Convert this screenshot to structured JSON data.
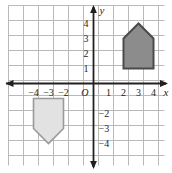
{
  "figure": {
    "origin_label": "O",
    "x_axis_label": "x",
    "y_axis_label": "y"
  },
  "colors": {
    "grid_line": "#b9b9b9",
    "axis_line": "#231f20",
    "background": "#ffffff",
    "shape_dark_fill": "#8c8c8c",
    "shape_dark_stroke": "#4a4a4a",
    "shape_light_fill": "#e2e2e2",
    "shape_light_stroke": "#9a9a9a",
    "text": "#231f20"
  },
  "chart_data": {
    "type": "scatter",
    "title": "",
    "xlabel": "x",
    "ylabel": "y",
    "grid": true,
    "legend": "none",
    "xlim": [
      -5.5,
      4.7
    ],
    "ylim": [
      -5.3,
      5
    ],
    "x_ticks": [
      {
        "value": -4,
        "label": "−4"
      },
      {
        "value": -3,
        "label": "−3"
      },
      {
        "value": -2,
        "label": "−2"
      },
      {
        "value": 1,
        "label": "1"
      },
      {
        "value": 2,
        "label": "2"
      },
      {
        "value": 3,
        "label": "3"
      },
      {
        "value": 4,
        "label": "4"
      }
    ],
    "y_ticks": [
      {
        "value": 4,
        "label": "4"
      },
      {
        "value": 3,
        "label": "3"
      },
      {
        "value": 2,
        "label": "2"
      },
      {
        "value": 1,
        "label": "1"
      },
      {
        "value": -2,
        "label": "−2"
      },
      {
        "value": -3,
        "label": "−3"
      },
      {
        "value": -4,
        "label": "−4"
      }
    ],
    "shapes": [
      {
        "name": "pentagon-upper-right",
        "style": "dark",
        "vertices": [
          [
            2,
            1
          ],
          [
            4,
            1
          ],
          [
            4,
            3
          ],
          [
            3,
            4
          ],
          [
            2,
            3
          ]
        ]
      },
      {
        "name": "pentagon-lower-left",
        "style": "light",
        "vertices": [
          [
            -4,
            -1
          ],
          [
            -2,
            -1
          ],
          [
            -2,
            -3
          ],
          [
            -3,
            -4
          ],
          [
            -4,
            -3
          ]
        ]
      }
    ]
  }
}
